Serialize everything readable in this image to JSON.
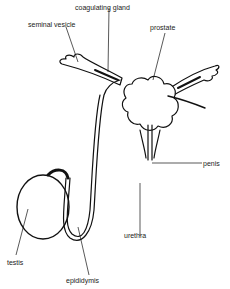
{
  "diagram": {
    "type": "anatomical-line-drawing",
    "labels": {
      "coagulating_gland": "coagulating gland",
      "seminal_vesicle": "seminal vesicle",
      "prostate": "prostate",
      "penis": "penis",
      "urethra": "urethra",
      "testis": "testis",
      "epididymis": "epididymis"
    },
    "colors": {
      "ink": "#111111",
      "background": "#ffffff"
    }
  }
}
